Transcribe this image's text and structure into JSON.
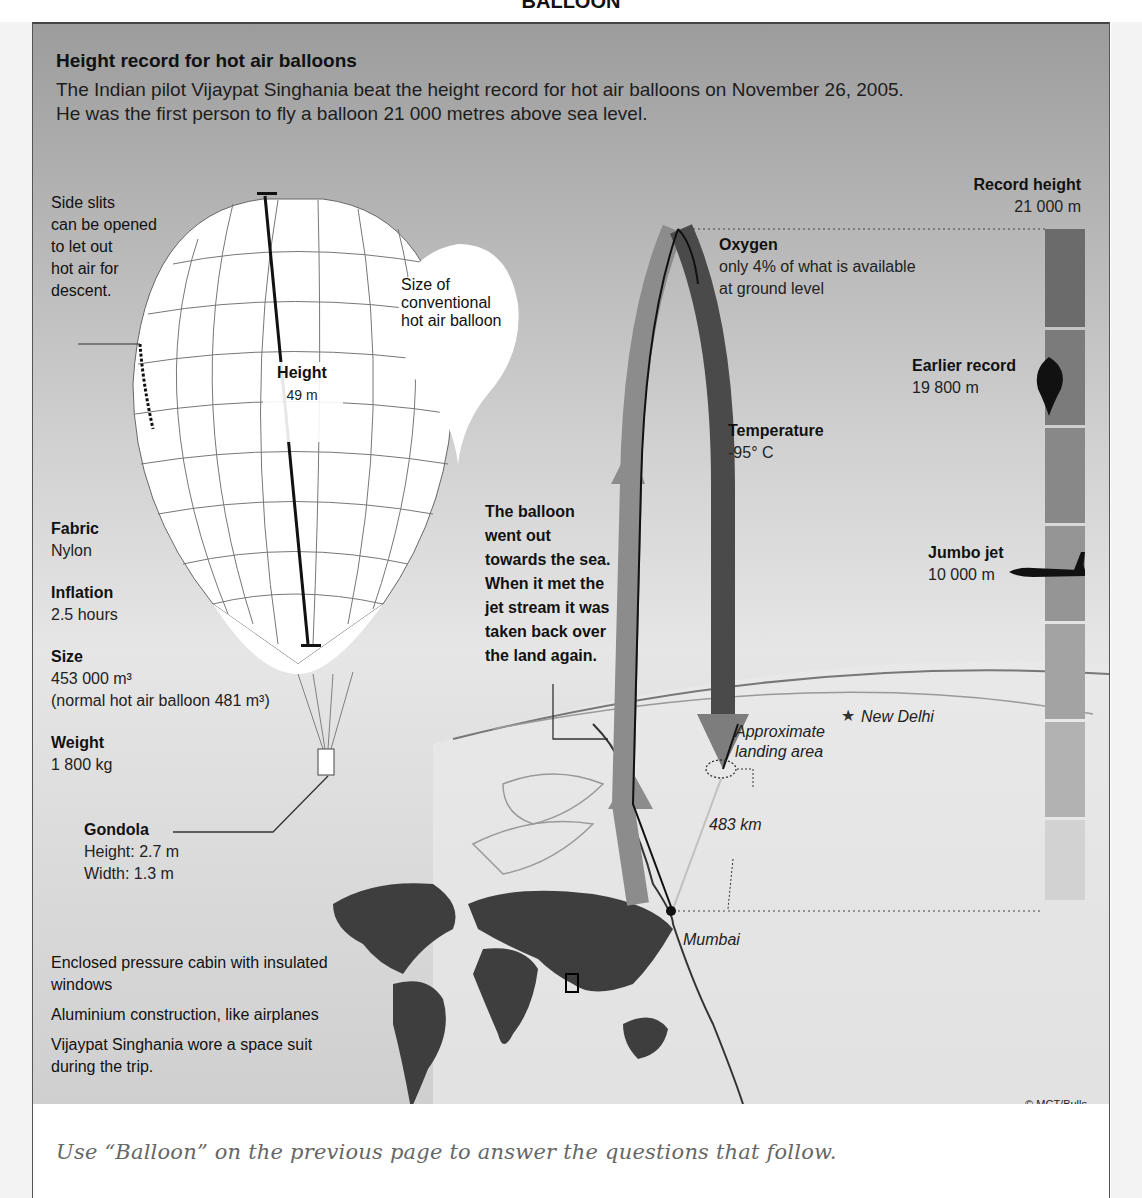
{
  "page": {
    "title": "BALLOON",
    "footer_note": "Use “Balloon” on the previous page to answer the questions that follow."
  },
  "infographic": {
    "title": "Height record for hot air balloons",
    "intro_line1": "The Indian pilot Vijaypat Singhania beat the height record for hot air balloons on November 26, 2005.",
    "intro_line2": "He was the first person to fly a balloon 21 000 metres above sea level.",
    "side_slits": [
      "Side slits",
      "can be opened",
      "to let out",
      "hot air for",
      "descent."
    ],
    "conventional_balloon": [
      "Size of",
      "conventional",
      "hot air balloon"
    ],
    "height": {
      "label": "Height",
      "value": "49 m"
    },
    "specs": [
      {
        "label": "Fabric",
        "value": "Nylon"
      },
      {
        "label": "Inflation",
        "value": "2.5 hours"
      },
      {
        "label": "Size",
        "value": "453 000 m³",
        "note": "(normal hot air balloon 481 m³)"
      },
      {
        "label": "Weight",
        "value": "1 800 kg"
      }
    ],
    "gondola": {
      "label": "Gondola",
      "height": "Height: 2.7 m",
      "width": "Width: 1.3 m"
    },
    "cabin_facts": [
      [
        "Enclosed pressure cabin with insulated",
        "windows"
      ],
      [
        "Aluminium construction, like airplanes"
      ],
      [
        "Vijaypat Singhania wore a space suit",
        "during the trip."
      ]
    ],
    "record_height": {
      "label": "Record height",
      "value": "21 000 m"
    },
    "oxygen": {
      "label": "Oxygen",
      "line1": "only 4% of what is available",
      "line2": "at ground level"
    },
    "earlier_record": {
      "label": "Earlier record",
      "value": "19 800 m"
    },
    "temperature": {
      "label": "Temperature",
      "value": "-95° C"
    },
    "jumbo_jet": {
      "label": "Jumbo jet",
      "value": "10 000 m"
    },
    "route_text": [
      "The balloon",
      "went out",
      "towards the sea.",
      "When it met the",
      "jet stream it was",
      "taken back over",
      "the land again."
    ],
    "map": {
      "new_delhi": "New Delhi",
      "landing_area": [
        "Approximate",
        "landing area"
      ],
      "distance": "483 km",
      "mumbai": "Mumbai"
    },
    "credit": "© MCT/Bulls",
    "colors": {
      "bar_dark": "#6b6b6b",
      "bar_mid": "#8a8a8a",
      "bar_light": "#a8a8a8",
      "continent": "#3e3e3e"
    }
  }
}
